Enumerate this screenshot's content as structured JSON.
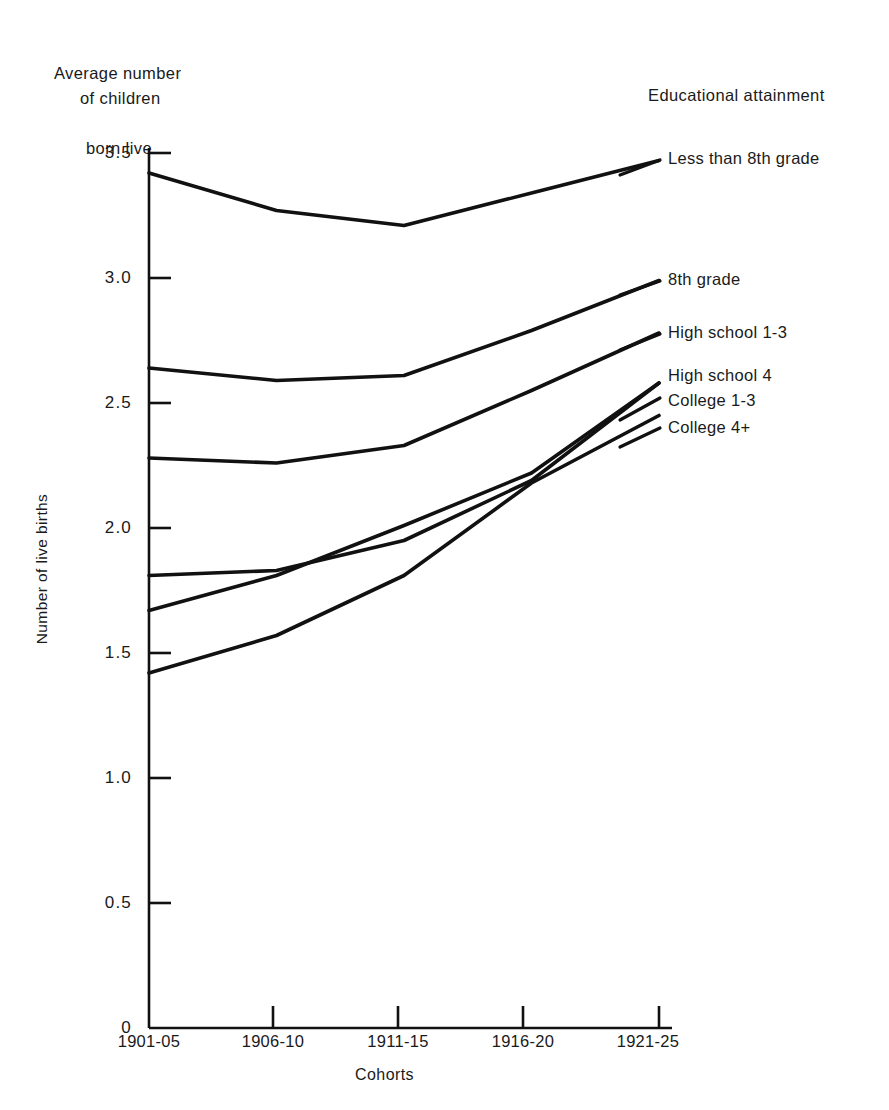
{
  "header": {
    "title_line1": "Average number",
    "title_line2": "of children",
    "title_line3": "born live",
    "legend_title": "Educational attainment"
  },
  "axes": {
    "ylabel": "Number of live births",
    "xlabel": "Cohorts",
    "yticks": [
      "0",
      "0.5",
      "1.0",
      "1.5",
      "2.0",
      "2.5",
      "3.0",
      "3.5"
    ],
    "xticks": [
      "1901-05",
      "1906-10",
      "1911-15",
      "1916-20",
      "1921-25"
    ]
  },
  "chart_data": {
    "type": "line",
    "title": "Average number of children born live",
    "xlabel": "Cohorts",
    "ylabel": "Number of live births",
    "categories": [
      "1901-05",
      "1906-10",
      "1911-15",
      "1916-20",
      "1921-25"
    ],
    "ylim": [
      0,
      3.6
    ],
    "yticks": [
      0,
      0.5,
      1.0,
      1.5,
      2.0,
      2.5,
      3.0,
      3.5
    ],
    "grid": false,
    "legend_position": "right-inline-labels",
    "legend_title": "Educational attainment",
    "series": [
      {
        "name": "Less than 8th grade",
        "values": [
          3.42,
          3.27,
          3.21,
          3.34,
          3.47
        ]
      },
      {
        "name": "8th grade",
        "values": [
          2.64,
          2.59,
          2.61,
          2.79,
          2.99
        ]
      },
      {
        "name": "High school  1-3",
        "values": [
          2.28,
          2.26,
          2.33,
          2.55,
          2.78
        ]
      },
      {
        "name": "High school 4",
        "values": [
          1.81,
          1.83,
          1.95,
          2.19,
          2.58
        ]
      },
      {
        "name": "College 1-3",
        "values": [
          1.67,
          1.81,
          2.01,
          2.22,
          2.58
        ]
      },
      {
        "name": "College 4+",
        "values": [
          1.42,
          1.57,
          1.81,
          2.18,
          2.45
        ]
      }
    ]
  },
  "series_labels": [
    {
      "text": "Less than 8th grade"
    },
    {
      "text": "8th grade"
    },
    {
      "text": "High school  1-3"
    },
    {
      "text": "High school 4"
    },
    {
      "text": "College 1-3"
    },
    {
      "text": "College 4+"
    }
  ]
}
